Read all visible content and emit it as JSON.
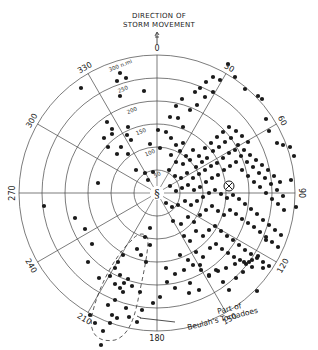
{
  "title": {
    "line1": "DIRECTION OF",
    "line2": "STORM MOVEMENT"
  },
  "center": {
    "x": 157,
    "y": 193
  },
  "ring_spacing_px": 23,
  "rings": [
    {
      "value": 50,
      "label": "50"
    },
    {
      "value": 100,
      "label": "100"
    },
    {
      "value": 150,
      "label": "150"
    },
    {
      "value": 200,
      "label": "200"
    },
    {
      "value": 250,
      "label": "250"
    },
    {
      "value": 300,
      "label": "300 n.mi"
    }
  ],
  "bearing_labels": [
    {
      "deg": 0,
      "label": "0"
    },
    {
      "deg": 30,
      "label": "30"
    },
    {
      "deg": 60,
      "label": "60"
    },
    {
      "deg": 90,
      "label": "90"
    },
    {
      "deg": 120,
      "label": "120"
    },
    {
      "deg": 150,
      "label": "150"
    },
    {
      "deg": 180,
      "label": "180"
    },
    {
      "deg": 210,
      "label": "210"
    },
    {
      "deg": 240,
      "label": "240"
    },
    {
      "deg": 270,
      "label": "270"
    },
    {
      "deg": 300,
      "label": "300"
    },
    {
      "deg": 330,
      "label": "330"
    }
  ],
  "annotation": {
    "line1": "Part of",
    "line2": "Beulah's Tornadoes"
  },
  "centroid_marker": {
    "x": 229,
    "y": 186,
    "symbol": "⊗"
  },
  "colors": {
    "ink": "#1a1a1a",
    "grid": "#444444",
    "background": "#ffffff"
  },
  "dots": [
    [
      81,
      88
    ],
    [
      120,
      73
    ],
    [
      126,
      78
    ],
    [
      117,
      81
    ],
    [
      144,
      91
    ],
    [
      120,
      96
    ],
    [
      107,
      122
    ],
    [
      112,
      129
    ],
    [
      112,
      134
    ],
    [
      128,
      127
    ],
    [
      127,
      135
    ],
    [
      131,
      140
    ],
    [
      121,
      147
    ],
    [
      128,
      154
    ],
    [
      117,
      154
    ],
    [
      104,
      138
    ],
    [
      108,
      147
    ],
    [
      98,
      183
    ],
    [
      136,
      170
    ],
    [
      145,
      173
    ],
    [
      153,
      172
    ],
    [
      148,
      180
    ],
    [
      150,
      144
    ],
    [
      160,
      148
    ],
    [
      158,
      130
    ],
    [
      166,
      132
    ],
    [
      178,
      118
    ],
    [
      183,
      127
    ],
    [
      190,
      110
    ],
    [
      197,
      105
    ],
    [
      205,
      97
    ],
    [
      213,
      92
    ],
    [
      220,
      80
    ],
    [
      228,
      64
    ],
    [
      235,
      77
    ],
    [
      245,
      89
    ],
    [
      258,
      96
    ],
    [
      262,
      99
    ],
    [
      266,
      119
    ],
    [
      269,
      131
    ],
    [
      277,
      143
    ],
    [
      283,
      145
    ],
    [
      290,
      147
    ],
    [
      294,
      156
    ],
    [
      291,
      180
    ],
    [
      296,
      207
    ],
    [
      170,
      117
    ],
    [
      176,
      106
    ],
    [
      182,
      99
    ],
    [
      195,
      92
    ],
    [
      200,
      88
    ],
    [
      206,
      82
    ],
    [
      213,
      77
    ],
    [
      171,
      138
    ],
    [
      176,
      145
    ],
    [
      183,
      143
    ],
    [
      180,
      151
    ],
    [
      186,
      156
    ],
    [
      193,
      150
    ],
    [
      199,
      156
    ],
    [
      205,
      148
    ],
    [
      211,
      143
    ],
    [
      217,
      137
    ],
    [
      223,
      132
    ],
    [
      229,
      127
    ],
    [
      236,
      131
    ],
    [
      242,
      136
    ],
    [
      248,
      142
    ],
    [
      171,
      155
    ],
    [
      176,
      162
    ],
    [
      183,
      164
    ],
    [
      190,
      160
    ],
    [
      196,
      167
    ],
    [
      202,
      162
    ],
    [
      207,
      158
    ],
    [
      213,
      151
    ],
    [
      219,
      147
    ],
    [
      225,
      142
    ],
    [
      231,
      138
    ],
    [
      238,
      145
    ],
    [
      244,
      150
    ],
    [
      250,
      155
    ],
    [
      256,
      160
    ],
    [
      262,
      165
    ],
    [
      268,
      170
    ],
    [
      274,
      176
    ],
    [
      280,
      182
    ],
    [
      169,
      170
    ],
    [
      175,
      176
    ],
    [
      181,
      178
    ],
    [
      187,
      173
    ],
    [
      193,
      178
    ],
    [
      199,
      174
    ],
    [
      205,
      170
    ],
    [
      211,
      166
    ],
    [
      217,
      163
    ],
    [
      223,
      158
    ],
    [
      229,
      153
    ],
    [
      235,
      150
    ],
    [
      241,
      156
    ],
    [
      247,
      162
    ],
    [
      253,
      167
    ],
    [
      259,
      173
    ],
    [
      265,
      178
    ],
    [
      271,
      184
    ],
    [
      277,
      190
    ],
    [
      283,
      196
    ],
    [
      170,
      186
    ],
    [
      176,
      191
    ],
    [
      182,
      188
    ],
    [
      188,
      185
    ],
    [
      194,
      190
    ],
    [
      200,
      187
    ],
    [
      206,
      182
    ],
    [
      212,
      178
    ],
    [
      218,
      175
    ],
    [
      224,
      170
    ],
    [
      230,
      166
    ],
    [
      236,
      162
    ],
    [
      242,
      170
    ],
    [
      248,
      176
    ],
    [
      254,
      182
    ],
    [
      260,
      187
    ],
    [
      266,
      193
    ],
    [
      272,
      199
    ],
    [
      278,
      204
    ],
    [
      284,
      210
    ],
    [
      166,
      203
    ],
    [
      172,
      207
    ],
    [
      178,
      205
    ],
    [
      185,
      201
    ],
    [
      191,
      205
    ],
    [
      197,
      201
    ],
    [
      203,
      197
    ],
    [
      209,
      193
    ],
    [
      215,
      190
    ],
    [
      221,
      194
    ],
    [
      227,
      198
    ],
    [
      233,
      195
    ],
    [
      239,
      199
    ],
    [
      245,
      204
    ],
    [
      251,
      209
    ],
    [
      257,
      214
    ],
    [
      263,
      220
    ],
    [
      269,
      225
    ],
    [
      275,
      230
    ],
    [
      281,
      235
    ],
    [
      173,
      221
    ],
    [
      181,
      224
    ],
    [
      188,
      217
    ],
    [
      194,
      222
    ],
    [
      200,
      215
    ],
    [
      206,
      210
    ],
    [
      212,
      206
    ],
    [
      218,
      211
    ],
    [
      224,
      215
    ],
    [
      230,
      210
    ],
    [
      236,
      214
    ],
    [
      242,
      219
    ],
    [
      248,
      223
    ],
    [
      254,
      227
    ],
    [
      260,
      232
    ],
    [
      266,
      237
    ],
    [
      272,
      242
    ],
    [
      278,
      247
    ],
    [
      184,
      236
    ],
    [
      190,
      241
    ],
    [
      196,
      231
    ],
    [
      203,
      236
    ],
    [
      209,
      230
    ],
    [
      215,
      226
    ],
    [
      221,
      231
    ],
    [
      227,
      236
    ],
    [
      233,
      240
    ],
    [
      239,
      245
    ],
    [
      245,
      250
    ],
    [
      251,
      254
    ],
    [
      257,
      258
    ],
    [
      263,
      262
    ],
    [
      269,
      266
    ],
    [
      180,
      255
    ],
    [
      188,
      260
    ],
    [
      196,
      252
    ],
    [
      203,
      257
    ],
    [
      210,
      248
    ],
    [
      216,
      244
    ],
    [
      222,
      249
    ],
    [
      228,
      253
    ],
    [
      234,
      257
    ],
    [
      240,
      260
    ],
    [
      246,
      264
    ],
    [
      252,
      267
    ],
    [
      166,
      268
    ],
    [
      175,
      274
    ],
    [
      184,
      270
    ],
    [
      193,
      265
    ],
    [
      201,
      270
    ],
    [
      209,
      275
    ],
    [
      218,
      271
    ],
    [
      226,
      268
    ],
    [
      235,
      264
    ],
    [
      244,
      262
    ],
    [
      252,
      260
    ],
    [
      258,
      256
    ],
    [
      145,
      237
    ],
    [
      150,
      245
    ],
    [
      141,
      255
    ],
    [
      146,
      262
    ],
    [
      150,
      228
    ],
    [
      137,
      249
    ],
    [
      123,
      255
    ],
    [
      115,
      268
    ],
    [
      110,
      276
    ],
    [
      115,
      284
    ],
    [
      120,
      288
    ],
    [
      124,
      283
    ],
    [
      128,
      279
    ],
    [
      120,
      275
    ],
    [
      118,
      262
    ],
    [
      123,
      292
    ],
    [
      132,
      286
    ],
    [
      140,
      292
    ],
    [
      142,
      310
    ],
    [
      129,
      317
    ],
    [
      137,
      322
    ],
    [
      126,
      308
    ],
    [
      115,
      300
    ],
    [
      112,
      315
    ],
    [
      117,
      318
    ],
    [
      110,
      323
    ],
    [
      103,
      331
    ],
    [
      95,
      323
    ],
    [
      90,
      315
    ],
    [
      108,
      305
    ],
    [
      99,
      278
    ],
    [
      88,
      262
    ],
    [
      92,
      244
    ],
    [
      85,
      229
    ],
    [
      44,
      206
    ],
    [
      75,
      218
    ],
    [
      101,
      345
    ],
    [
      153,
      303
    ],
    [
      160,
      297
    ],
    [
      167,
      282
    ],
    [
      175,
      288
    ],
    [
      189,
      293
    ],
    [
      199,
      290
    ],
    [
      209,
      276
    ],
    [
      216,
      270
    ],
    [
      223,
      282
    ],
    [
      229,
      290
    ],
    [
      236,
      278
    ],
    [
      243,
      272
    ],
    [
      249,
      262
    ],
    [
      263,
      268
    ],
    [
      266,
      240
    ],
    [
      257,
      291
    ],
    [
      200,
      265
    ],
    [
      190,
      283
    ]
  ]
}
